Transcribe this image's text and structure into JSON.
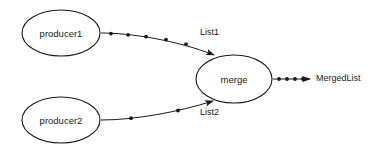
{
  "diagram": {
    "background_color": "#ffffff",
    "stroke_color": "#1a1a1a",
    "nodes": [
      {
        "id": "producer1",
        "label": "producer1",
        "shape": "ellipse",
        "cx": 61,
        "cy": 33,
        "rx": 39,
        "ry": 23
      },
      {
        "id": "producer2",
        "label": "producer2",
        "shape": "ellipse",
        "cx": 61,
        "cy": 120,
        "rx": 39,
        "ry": 23
      },
      {
        "id": "merge",
        "label": "merge",
        "shape": "ellipse",
        "cx": 234,
        "cy": 79,
        "rx": 38,
        "ry": 24
      }
    ],
    "edges": [
      {
        "id": "list1",
        "label": "List1",
        "from": "producer1",
        "to": "merge",
        "label_x": 200,
        "label_y": 33,
        "token_count": 5,
        "path": "M 101 33 C 130 33 176 40 214 55"
      },
      {
        "id": "list2",
        "label": "List2",
        "from": "producer2",
        "to": "merge",
        "label_x": 200,
        "label_y": 113,
        "token_count": 2,
        "path": "M 101 120 C 135 120 178 112 213 101"
      },
      {
        "id": "mergedlist",
        "label": "MergedList",
        "from": "merge",
        "to": "output",
        "label_x": 316,
        "label_y": 79,
        "token_count": 4,
        "path": "M 273 79 L 310 79"
      }
    ]
  }
}
